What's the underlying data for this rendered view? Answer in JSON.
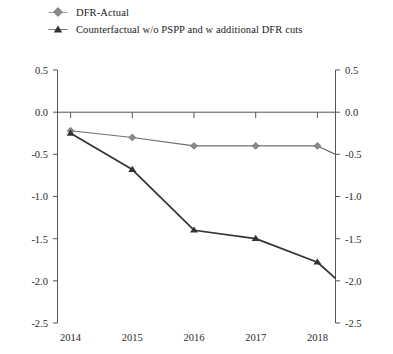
{
  "chart_data": {
    "type": "line",
    "title": "",
    "subtitle": "",
    "xlabel": "",
    "ylabel": "",
    "categories": [
      "2014",
      "2015",
      "2016",
      "2017",
      "2018"
    ],
    "x_tick_labels": [
      "2014",
      "2015",
      "2016",
      "2017",
      "2018"
    ],
    "y_tick_labels": [
      "0.5",
      "0.0",
      "-0.5",
      "-1.0",
      "-1.5",
      "-2.0",
      "-2.5"
    ],
    "y_tick_values": [
      0.5,
      0.0,
      -0.5,
      -1.0,
      -1.5,
      -2.0,
      -2.5
    ],
    "ylim": [
      -2.5,
      0.5
    ],
    "grid": false,
    "dual_y_axis": true,
    "right_y_tick_labels": [
      "0.5",
      "0.0",
      "-0.5",
      "-1.0",
      "-1.5",
      "-2.0",
      "-2.5"
    ],
    "legend_position": "top-left",
    "zero_line": true,
    "series": [
      {
        "name": "DFR-Actual",
        "marker": "diamond",
        "color": "#6e6e6e",
        "values": [
          -0.22,
          -0.3,
          -0.4,
          -0.4,
          -0.4
        ],
        "end_value": -0.5
      },
      {
        "name": "Counterfactual w/o PSPP and w additional DFR cuts",
        "marker": "triangle",
        "color": "#333333",
        "values": [
          -0.25,
          -0.68,
          -1.4,
          -1.5,
          -1.78
        ],
        "end_value": -1.97
      }
    ]
  },
  "legend": {
    "items": [
      {
        "label": "DFR-Actual",
        "marker": "diamond-marker-icon"
      },
      {
        "label": "Counterfactual w/o PSPP and w additional DFR cuts",
        "marker": "triangle-marker-icon"
      }
    ]
  },
  "axes": {
    "left": {
      "labels": [
        "0.5",
        "0.0",
        "-0.5",
        "-1.0",
        "-1.5",
        "-2.0",
        "-2.5"
      ]
    },
    "right": {
      "labels": [
        "0.5",
        "0.0",
        "-0.5",
        "-1.0",
        "-1.5",
        "-2.0",
        "-2.5"
      ]
    },
    "bottom": {
      "labels": [
        "2014",
        "2015",
        "2016",
        "2017",
        "2018"
      ]
    }
  },
  "colors": {
    "actual_series": "#6e6e6e",
    "counterfactual_series": "#333333",
    "axis": "#555555",
    "text": "#222222"
  }
}
